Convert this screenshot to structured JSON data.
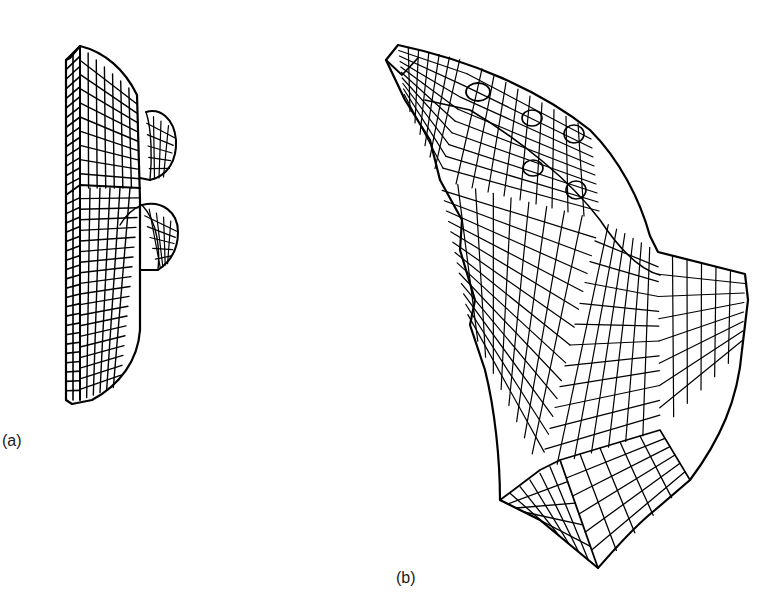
{
  "figure": {
    "background": "#ffffff",
    "ink_color": "#000000",
    "panels": [
      {
        "id": "a",
        "caption": "(a)",
        "description": "Finite-element wireframe mesh of a flanged bracket with two cylindrical bosses",
        "bosses": 2
      },
      {
        "id": "b",
        "caption": "(b)",
        "description": "Finite-element wireframe mesh of a curved tapered component with five circular holes along the upper arm",
        "holes": 5
      }
    ]
  }
}
